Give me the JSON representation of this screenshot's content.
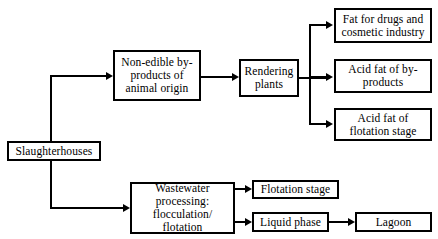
{
  "diagram": {
    "background_color": "#ffffff",
    "line_color": "#000000",
    "text_color": "#000000",
    "nodes": {
      "slaughterhouses": "Slaughterhouses",
      "non_edible": "Non-edible by-\nproducts of\nanimal origin",
      "rendering_plants": "Rendering\nplants",
      "fat_for_drugs": "Fat for drugs and\ncosmetic industry",
      "acid_fat_byproducts": "Acid fat of by-\nproducts",
      "acid_fat_flotation": "Acid fat of\nflotation stage",
      "wastewater": "Wastewater\nprocessing:\nflocculation/ flotation",
      "flotation_stage": "Flotation stage",
      "liquid_phase": "Liquid phase",
      "lagoon": "Lagoon"
    },
    "edges": [
      {
        "from": "slaughterhouses",
        "to": "non_edible"
      },
      {
        "from": "slaughterhouses",
        "to": "wastewater"
      },
      {
        "from": "non_edible",
        "to": "rendering_plants"
      },
      {
        "from": "rendering_plants",
        "to": "fat_for_drugs"
      },
      {
        "from": "rendering_plants",
        "to": "acid_fat_byproducts"
      },
      {
        "from": "rendering_plants",
        "to": "acid_fat_flotation"
      },
      {
        "from": "wastewater",
        "to": "flotation_stage"
      },
      {
        "from": "wastewater",
        "to": "liquid_phase"
      },
      {
        "from": "liquid_phase",
        "to": "lagoon"
      }
    ]
  }
}
